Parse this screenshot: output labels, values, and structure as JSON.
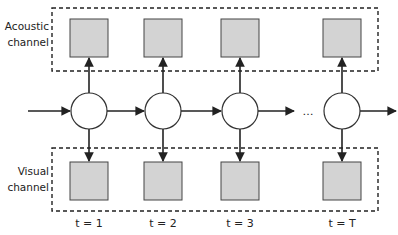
{
  "diagram": {
    "type": "multimodal-hmm",
    "channels": {
      "top": {
        "label_line1": "Acoustic",
        "label_line2": "channel"
      },
      "bottom": {
        "label_line1": "Visual",
        "label_line2": "channel"
      }
    },
    "time_steps": [
      {
        "label": "t = 1"
      },
      {
        "label": "t = 2"
      },
      {
        "label": "t = 3"
      },
      {
        "label": "t = T"
      }
    ],
    "ellipsis": "…",
    "colors": {
      "observation_fill": "#d3d3d3",
      "stroke": "#333333",
      "state_fill": "#ffffff"
    }
  }
}
